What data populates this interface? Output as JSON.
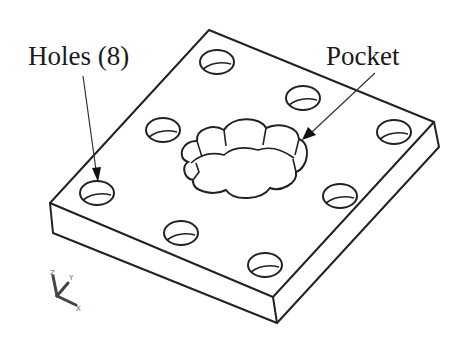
{
  "figure": {
    "type": "isometric CAD model illustration",
    "background": "#ffffff",
    "line_color": "#222222"
  },
  "callouts": {
    "holes": {
      "label": "Holes (8)"
    },
    "pocket": {
      "label": "Pocket"
    }
  },
  "part": {
    "name": "square plate",
    "features": [
      {
        "type": "hole",
        "count": 8
      },
      {
        "type": "pocket",
        "shape": "scalloped / flower",
        "count": 1
      }
    ]
  },
  "triad": {
    "axes": [
      "Z",
      "Y",
      "X"
    ]
  }
}
